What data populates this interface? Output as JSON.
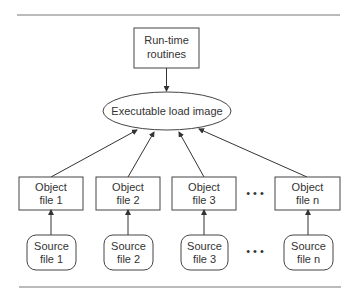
{
  "diagram": {
    "runtime": {
      "line1": "Run-time",
      "line2": "routines"
    },
    "executable": {
      "label": "Executable load image"
    },
    "objects": [
      {
        "line1": "Object",
        "line2": "file 1"
      },
      {
        "line1": "Object",
        "line2": "file 2"
      },
      {
        "line1": "Object",
        "line2": "file 3"
      },
      {
        "line1": "Object",
        "line2": "file n"
      }
    ],
    "sources": [
      {
        "line1": "Source",
        "line2": "file 1"
      },
      {
        "line1": "Source",
        "line2": "file 2"
      },
      {
        "line1": "Source",
        "line2": "file 3"
      },
      {
        "line1": "Source",
        "line2": "file n"
      }
    ],
    "ellipsis": "• • •"
  }
}
